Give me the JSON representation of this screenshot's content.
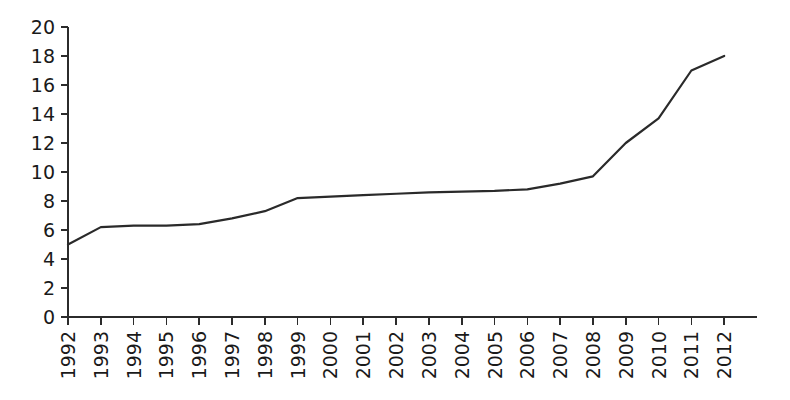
{
  "chart_data": {
    "type": "line",
    "title": "",
    "subtitle": "",
    "xlabel": "",
    "ylabel": "",
    "categories": [
      "1992",
      "1993",
      "1994",
      "1995",
      "1996",
      "1997",
      "1998",
      "1999",
      "2000",
      "2001",
      "2002",
      "2003",
      "2004",
      "2005",
      "2006",
      "2007",
      "2008",
      "2009",
      "2010",
      "2011",
      "2012"
    ],
    "values": [
      5.0,
      6.2,
      6.3,
      6.3,
      6.4,
      6.8,
      7.3,
      8.2,
      8.3,
      8.4,
      8.5,
      8.6,
      8.65,
      8.7,
      8.8,
      9.2,
      9.7,
      12.0,
      13.7,
      17.0,
      18.0
    ],
    "series": [
      {
        "name": "series-1",
        "values": [
          5.0,
          6.2,
          6.3,
          6.3,
          6.4,
          6.8,
          7.3,
          8.2,
          8.3,
          8.4,
          8.5,
          8.6,
          8.65,
          8.7,
          8.8,
          9.2,
          9.7,
          12.0,
          13.7,
          17.0,
          18.0
        ],
        "color": "#2a2a2a"
      }
    ],
    "ylim": [
      0,
      20
    ],
    "yticks": [
      0,
      2,
      4,
      6,
      8,
      10,
      12,
      14,
      16,
      18,
      20
    ],
    "ytick_labels": [
      "0",
      "2",
      "4",
      "6",
      "8",
      "10",
      "12",
      "14",
      "16",
      "18",
      "20"
    ],
    "xtick_labels": [
      "1992",
      "1993",
      "1994",
      "1995",
      "1996",
      "1997",
      "1998",
      "1999",
      "2000",
      "2001",
      "2002",
      "2003",
      "2004",
      "2005",
      "2006",
      "2007",
      "2008",
      "2009",
      "2010",
      "2011",
      "2012"
    ],
    "xtick_label_rotation": -90,
    "grid": false,
    "legend": false,
    "legend_position": "none",
    "annotations": [],
    "axis_color": "#2b2b2b",
    "background_color": "#ffffff"
  },
  "layout": {
    "plot_left": 68,
    "plot_right": 757,
    "plot_top": 27,
    "plot_bottom": 317,
    "tick_length": 7,
    "x_tick_length": 8
  }
}
